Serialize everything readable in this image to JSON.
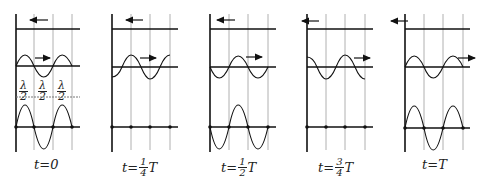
{
  "panels": [
    {
      "label_prefix": "t=",
      "label_value": "0",
      "frac": null,
      "label_suffix": ""
    },
    {
      "label_prefix": "t=",
      "frac": {
        "num": "1",
        "den": "4"
      },
      "label_suffix": "T"
    },
    {
      "label_prefix": "t=",
      "frac": {
        "num": "1",
        "den": "2"
      },
      "label_suffix": "T"
    },
    {
      "label_prefix": "t=",
      "frac": {
        "num": "3",
        "den": "4"
      },
      "label_suffix": "T"
    },
    {
      "label_prefix": "t=",
      "label_value": "T",
      "frac": null,
      "label_suffix": ""
    }
  ],
  "captions": [
    "t=0",
    "t=1/4 T",
    "t=1/2 T",
    "t=3/4 T",
    "t=T"
  ],
  "spacing_label": {
    "num": "λ",
    "den": "2"
  },
  "colors": {
    "line": "#111111",
    "grid": "#b0b0b0",
    "background": "#ffffff"
  }
}
